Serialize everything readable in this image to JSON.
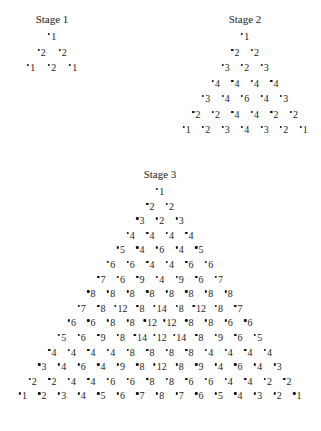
{
  "stages": [
    {
      "title": "Stage 1",
      "center_x": 52,
      "title_y": 13,
      "row_start_y": 31,
      "row_step": 15.5,
      "col_step": 21,
      "rows": [
        [
          1
        ],
        [
          2,
          2
        ],
        [
          1,
          2,
          1
        ]
      ]
    },
    {
      "title": "Stage 2",
      "center_x": 245,
      "title_y": 13,
      "row_start_y": 31,
      "row_step": 15.5,
      "col_step": 19.5,
      "rows": [
        [
          1
        ],
        [
          2,
          2
        ],
        [
          3,
          2,
          3
        ],
        [
          4,
          4,
          4,
          4
        ],
        [
          3,
          4,
          6,
          4,
          3
        ],
        [
          2,
          2,
          4,
          4,
          2,
          2
        ],
        [
          1,
          2,
          3,
          4,
          3,
          2,
          1
        ]
      ]
    },
    {
      "title": "Stage 3",
      "center_x": 160,
      "title_y": 168,
      "row_start_y": 186,
      "row_step": 14.6,
      "col_step": 19.6,
      "rows": [
        [
          1
        ],
        [
          2,
          2
        ],
        [
          3,
          2,
          3
        ],
        [
          4,
          4,
          4,
          4
        ],
        [
          5,
          4,
          6,
          4,
          5
        ],
        [
          6,
          6,
          4,
          4,
          6,
          6
        ],
        [
          7,
          6,
          9,
          4,
          9,
          6,
          7
        ],
        [
          8,
          8,
          8,
          8,
          8,
          8,
          8,
          8
        ],
        [
          7,
          8,
          12,
          8,
          14,
          8,
          12,
          8,
          7
        ],
        [
          6,
          6,
          8,
          8,
          12,
          12,
          8,
          8,
          6,
          6
        ],
        [
          5,
          6,
          9,
          8,
          14,
          12,
          14,
          8,
          9,
          6,
          5
        ],
        [
          4,
          4,
          4,
          4,
          8,
          8,
          8,
          8,
          4,
          4,
          4,
          4
        ],
        [
          3,
          4,
          6,
          4,
          9,
          8,
          12,
          8,
          9,
          4,
          6,
          4,
          3
        ],
        [
          2,
          2,
          4,
          4,
          6,
          6,
          8,
          8,
          6,
          6,
          4,
          4,
          2,
          2
        ],
        [
          1,
          2,
          3,
          4,
          5,
          6,
          7,
          8,
          7,
          6,
          5,
          4,
          3,
          2,
          1
        ]
      ]
    }
  ]
}
